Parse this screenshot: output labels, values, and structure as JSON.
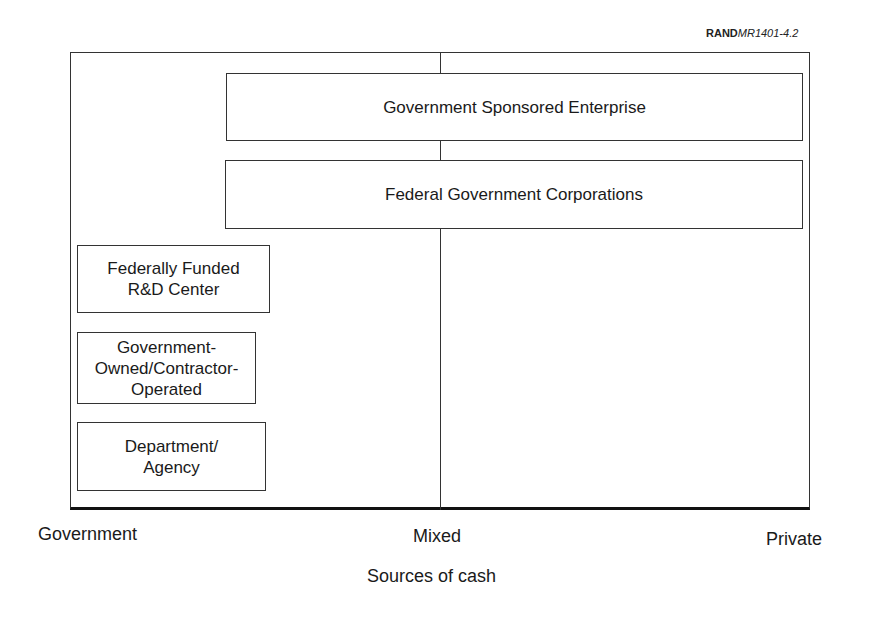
{
  "figure_ref": {
    "prefix": "RAND",
    "code": "MR1401-4.2"
  },
  "axis": {
    "title": "Sources of cash",
    "labels": {
      "left": "Government",
      "middle": "Mixed",
      "right": "Private"
    }
  },
  "boxes": [
    {
      "id": "gse",
      "label": "Government Sponsored Enterprise"
    },
    {
      "id": "fgc",
      "label": "Federal Government Corporations"
    },
    {
      "id": "ffrdc",
      "label": "Federally Funded\nR&D Center"
    },
    {
      "id": "goco",
      "label": "Government-\nOwned/Contractor-\nOperated"
    },
    {
      "id": "dept",
      "label": "Department/\nAgency"
    }
  ],
  "colors": {
    "line": "#333333",
    "text": "#1a1a1a",
    "background": "#ffffff"
  }
}
